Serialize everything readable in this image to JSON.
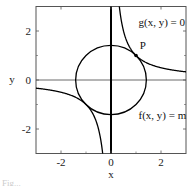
{
  "chart_data": {
    "type": "line",
    "title": "",
    "xlabel": "x",
    "ylabel": "y",
    "xlim": [
      -3,
      3
    ],
    "ylim": [
      -3,
      3
    ],
    "x_ticks": [
      -2,
      0,
      2
    ],
    "y_ticks": [
      -2,
      0,
      2
    ],
    "x_tick_labels": [
      "-2",
      "0",
      "2"
    ],
    "y_tick_labels": [
      "-2",
      "0",
      "2"
    ],
    "grid": false,
    "series": [
      {
        "name": "f(x, y) = m",
        "kind": "circle",
        "center": [
          0,
          0
        ],
        "radius": 1.414
      },
      {
        "name": "g(x, y) = 0",
        "kind": "hyperbola",
        "equation": "xy = 1"
      }
    ],
    "points": [
      {
        "label": "P",
        "x": 1,
        "y": 1
      }
    ],
    "annotations": [
      {
        "text": "g(x, y) = 0",
        "x": 1.1,
        "y": 2.2
      },
      {
        "text": "P",
        "x": 1.15,
        "y": 1.25
      },
      {
        "text": "f(x, y) = m",
        "x": 1.1,
        "y": -1.6
      }
    ]
  },
  "caption": "Fig..."
}
